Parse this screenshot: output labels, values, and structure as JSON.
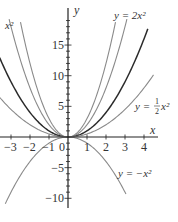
{
  "chart_data": {
    "type": "line",
    "title": "",
    "xlabel": "x",
    "ylabel": "y",
    "xlim": [
      -3.6,
      4.6
    ],
    "ylim": [
      -11,
      20
    ],
    "x_ticks": [
      -3,
      -2,
      -1,
      0,
      1,
      2,
      3,
      4
    ],
    "x_tick_labels": [
      "−3",
      "−2",
      "−1",
      "0",
      "1",
      "2",
      "3",
      "4"
    ],
    "y_ticks": [
      -10,
      -5,
      5,
      10,
      15
    ],
    "y_tick_labels": [
      "−10",
      "−5",
      "5",
      "10",
      "15"
    ],
    "grid": false,
    "series": [
      {
        "name": "y = 3x²",
        "label_visible": "x²",
        "coef": 3,
        "color": "#8a8a8a",
        "width": 1.1,
        "domain": [
          -2.5,
          2.5
        ]
      },
      {
        "name": "y = 2x²",
        "label": "y = 2x²",
        "coef": 2,
        "color": "#8a8a8a",
        "width": 1.1,
        "domain": [
          -3.1,
          3.1
        ]
      },
      {
        "name": "y = x²",
        "label": "",
        "coef": 1,
        "color": "#2b2b2b",
        "width": 1.5,
        "domain": [
          -3.6,
          4.2
        ]
      },
      {
        "name": "y = ½x²",
        "label": "y = ½x²",
        "coef": 0.5,
        "color": "#8a8a8a",
        "width": 1.1,
        "domain": [
          -3.6,
          4.5
        ]
      },
      {
        "name": "y = −x²",
        "label": "y = −x²",
        "coef": -1,
        "color": "#8a8a8a",
        "width": 1.1,
        "domain": [
          -3.3,
          3.05
        ]
      }
    ]
  },
  "labels": {
    "y_axis": "y",
    "x_axis": "x",
    "top_left": "x²",
    "two_x2": "y = 2x²",
    "half_x2_prefix": "y =",
    "half_num": "1",
    "half_den": "2",
    "half_suffix": "x²",
    "neg_x2": "y = −x²",
    "origin": "0"
  }
}
